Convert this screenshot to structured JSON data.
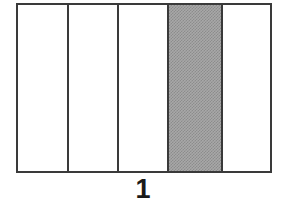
{
  "figure": {
    "caption": "1",
    "colors": {
      "outline": "#3a3a3a",
      "empty_fill": "#ffffff",
      "shaded_fill": "#a8a8a8",
      "caption_color": "#1a1a1a",
      "background": "#ffffff"
    },
    "geometry": {
      "bar_left": 16,
      "bar_top": 3,
      "bar_width": 256,
      "bar_height": 170,
      "border_width": 2,
      "divider_positions": [
        66,
        117,
        167,
        222
      ],
      "caption_left": 108,
      "caption_top": 176,
      "caption_width": 70,
      "caption_font_size": 27
    },
    "cells": [
      {
        "index": 1,
        "width": 50,
        "shaded": false,
        "fill_label": "white"
      },
      {
        "index": 2,
        "width": 51,
        "shaded": false,
        "fill_label": "white"
      },
      {
        "index": 3,
        "width": 50,
        "shaded": false,
        "fill_label": "white"
      },
      {
        "index": 4,
        "width": 55,
        "shaded": true,
        "fill_label": "gray"
      },
      {
        "index": 5,
        "width": 50,
        "shaded": false,
        "fill_label": "white"
      }
    ],
    "summary": {
      "total_cells": 5,
      "shaded_cells": 1,
      "shaded_index": 4,
      "fraction_text": "1"
    }
  }
}
